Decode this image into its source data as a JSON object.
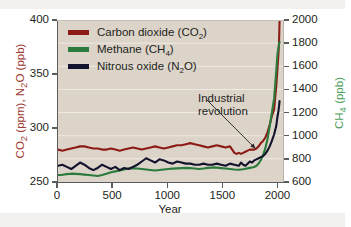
{
  "chart_data": {
    "type": "line",
    "title": "",
    "xlabel": "Year",
    "ylabel_left": "CO₂ (ppm), N₂O (ppb)",
    "ylabel_right": "CH₄ (ppb)",
    "grid": true,
    "legend_position": "top-left",
    "xlim": [
      0,
      2050
    ],
    "xticks": [
      0,
      500,
      1000,
      1500,
      2000
    ],
    "xticklabels": [
      "0",
      "500",
      "1000",
      "1500",
      "2000"
    ],
    "ylim_left": [
      250,
      400
    ],
    "yticks_left": [
      250,
      300,
      350,
      400
    ],
    "yticklabels_left": [
      "250",
      "300",
      "350",
      "400"
    ],
    "ylim_right": [
      600,
      2000
    ],
    "yticks_right": [
      600,
      800,
      1000,
      1200,
      1400,
      1600,
      1800,
      2000
    ],
    "yticklabels_right": [
      "600",
      "800",
      "1000",
      "1200",
      "1400",
      "1600",
      "1800",
      "2000"
    ],
    "annotations": [
      {
        "text_line1": "Industrial",
        "text_line2": "revolution",
        "points_to_year": 1800,
        "points_to_value_co2": 280
      }
    ],
    "series": [
      {
        "name": "Carbon dioxide (CO2)",
        "label_html": "Carbon dioxide (CO<sub>2</sub>)",
        "axis": "left",
        "unit": "ppm",
        "color": "#8d1b15",
        "x": [
          0,
          40,
          80,
          120,
          160,
          200,
          240,
          280,
          320,
          360,
          400,
          440,
          480,
          520,
          560,
          600,
          640,
          680,
          720,
          760,
          800,
          840,
          880,
          920,
          960,
          1000,
          1040,
          1080,
          1120,
          1160,
          1200,
          1240,
          1280,
          1320,
          1360,
          1400,
          1440,
          1480,
          1520,
          1560,
          1600,
          1620,
          1640,
          1660,
          1680,
          1700,
          1720,
          1740,
          1760,
          1780,
          1800,
          1820,
          1840,
          1860,
          1880,
          1900,
          1920,
          1940,
          1960,
          1980,
          1990,
          2000,
          2005,
          2010
        ],
        "values": [
          280,
          279,
          280,
          281,
          282,
          283,
          283,
          282,
          281,
          281,
          280,
          280,
          281,
          280,
          279,
          280,
          281,
          282,
          281,
          280,
          281,
          282,
          283,
          282,
          281,
          282,
          283,
          284,
          284,
          285,
          286,
          285,
          284,
          283,
          282,
          283,
          284,
          283,
          282,
          283,
          277,
          276,
          277,
          276,
          277,
          278,
          279,
          280,
          280,
          280,
          281,
          283,
          286,
          288,
          291,
          296,
          303,
          311,
          317,
          339,
          354,
          369,
          379,
          400
        ]
      },
      {
        "name": "Methane (CH4)",
        "label_html": "Methane (CH<sub>4</sub>)",
        "axis": "right",
        "unit": "ppb",
        "color": "#2b7b3c",
        "x": [
          0,
          40,
          80,
          120,
          160,
          200,
          240,
          280,
          320,
          360,
          400,
          440,
          480,
          520,
          560,
          600,
          640,
          680,
          720,
          760,
          800,
          840,
          880,
          920,
          960,
          1000,
          1040,
          1080,
          1120,
          1160,
          1200,
          1240,
          1280,
          1320,
          1360,
          1400,
          1440,
          1480,
          1520,
          1560,
          1600,
          1640,
          1680,
          1700,
          1720,
          1740,
          1760,
          1780,
          1800,
          1820,
          1840,
          1860,
          1880,
          1900,
          1920,
          1940,
          1960,
          1980,
          1990,
          2000,
          2005,
          2010
        ],
        "values": [
          660,
          662,
          668,
          672,
          670,
          668,
          664,
          660,
          656,
          652,
          660,
          672,
          684,
          692,
          700,
          708,
          716,
          720,
          716,
          712,
          708,
          704,
          700,
          704,
          708,
          712,
          716,
          718,
          720,
          722,
          720,
          716,
          712,
          716,
          722,
          726,
          724,
          720,
          716,
          712,
          708,
          706,
          710,
          714,
          718,
          722,
          726,
          730,
          740,
          760,
          790,
          830,
          890,
          970,
          1080,
          1200,
          1320,
          1560,
          1700,
          1760,
          1790,
          1810
        ]
      },
      {
        "name": "Nitrous oxide (N2O)",
        "label_html": "Nitrous oxide (N<sub>2</sub>O)",
        "axis": "left",
        "unit": "ppb",
        "color": "#12122c",
        "x": [
          0,
          40,
          80,
          120,
          160,
          200,
          240,
          280,
          320,
          360,
          400,
          440,
          480,
          520,
          560,
          600,
          640,
          680,
          720,
          760,
          800,
          840,
          880,
          920,
          960,
          1000,
          1040,
          1080,
          1120,
          1160,
          1200,
          1240,
          1280,
          1320,
          1360,
          1400,
          1440,
          1480,
          1520,
          1560,
          1600,
          1640,
          1660,
          1680,
          1700,
          1720,
          1740,
          1760,
          1780,
          1800,
          1820,
          1840,
          1860,
          1880,
          1900,
          1920,
          1940,
          1960,
          1980,
          1990,
          2000,
          2005,
          2010
        ],
        "values": [
          265,
          266,
          264,
          262,
          265,
          268,
          266,
          263,
          261,
          263,
          266,
          264,
          262,
          264,
          261,
          263,
          262,
          264,
          266,
          269,
          272,
          270,
          268,
          271,
          270,
          268,
          267,
          269,
          268,
          267,
          267,
          266,
          266,
          267,
          266,
          266,
          267,
          266,
          265,
          267,
          266,
          265,
          268,
          266,
          265,
          267,
          269,
          268,
          270,
          271,
          272,
          273,
          274,
          276,
          279,
          283,
          288,
          294,
          302,
          310,
          316,
          320,
          325
        ]
      }
    ]
  },
  "legend": {
    "items": [
      {
        "label": "Carbon dioxide (CO₂)",
        "color": "#8d1b15"
      },
      {
        "label": "Methane (CH₄)",
        "color": "#2b7b3c"
      },
      {
        "label": "Nitrous oxide (N₂O)",
        "color": "#12122c"
      }
    ]
  },
  "colors": {
    "plot_background": "#dcd3c9",
    "gridline": "#efeae4",
    "axis": "#5b5b5b",
    "text": "#231f20",
    "left_axis_title": "#9e3b34",
    "right_axis_title": "#4e9e5c",
    "page_background": "#ffffff",
    "edge_band": "#f2f1ef"
  }
}
